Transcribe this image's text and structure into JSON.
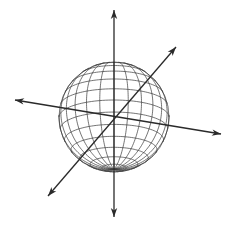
{
  "figure": {
    "background": "#ffffff",
    "stroke_color": "#2a2a2a",
    "sphere": {
      "center": [
        114,
        117
      ],
      "radius": 55,
      "tilt_deg": 18,
      "latitude_lines": 14,
      "longitude_lines": 24
    },
    "axes": [
      {
        "name": "vertical",
        "from": [
          114,
          217
        ],
        "to": [
          114,
          10
        ],
        "arrows": "both"
      },
      {
        "name": "horizontal",
        "from": [
          15,
          100
        ],
        "to": [
          221,
          134
        ],
        "arrows": "both"
      },
      {
        "name": "diagonal",
        "from": [
          48,
          196
        ],
        "to": [
          176,
          47
        ],
        "arrows": "both"
      }
    ]
  }
}
